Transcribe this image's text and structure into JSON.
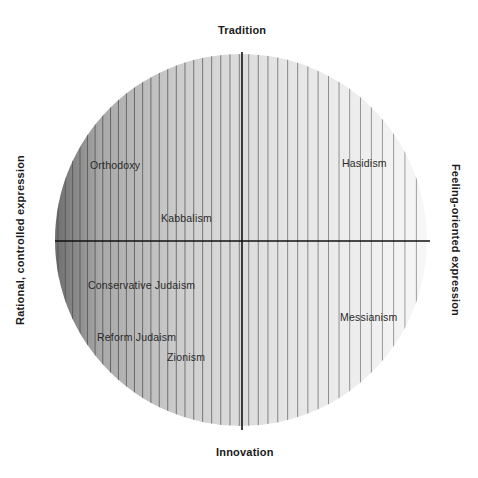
{
  "diagram": {
    "axes": {
      "top": "Tradition",
      "bottom": "Innovation",
      "left": "Rational, controlled expression",
      "right": "Feeling-oriented expression"
    },
    "items": [
      {
        "label": "Orthodoxy",
        "x": 90,
        "y": 165
      },
      {
        "label": "Kabbalism",
        "x": 161,
        "y": 218
      },
      {
        "label": "Hasidism",
        "x": 342,
        "y": 162
      },
      {
        "label": "Conservative Judaism",
        "x": 88,
        "y": 285
      },
      {
        "label": "Reform Judaism",
        "x": 97,
        "y": 337
      },
      {
        "label": "Zionism",
        "x": 167,
        "y": 357
      },
      {
        "label": "Messianism",
        "x": 340,
        "y": 317
      }
    ],
    "colors": {
      "dark_edge": "#7a7a7a",
      "light_edge": "#f2f2f2",
      "stripe": "#8a8a8a",
      "axis_line": "#111111"
    }
  }
}
